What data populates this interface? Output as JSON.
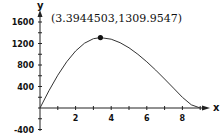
{
  "chart_data": {
    "type": "line",
    "title": "",
    "xlabel": "x",
    "ylabel": "y",
    "xlim": [
      0,
      9.2
    ],
    "ylim": [
      -400,
      1800
    ],
    "grid": false,
    "legend": null,
    "x_ticks": [
      2,
      4,
      6,
      8
    ],
    "x_tick_labels": [
      "2",
      "4",
      "6",
      "8"
    ],
    "y_ticks": [
      -400,
      400,
      800,
      1200,
      1600
    ],
    "y_tick_labels": [
      "-400",
      "400",
      "800",
      "1200",
      "1600"
    ],
    "series": [
      {
        "name": "curve",
        "x": [
          0,
          0.5,
          1,
          1.5,
          2,
          2.5,
          3,
          3.3944503,
          4,
          4.5,
          5,
          5.5,
          6,
          6.5,
          7,
          7.5,
          8,
          8.5,
          9
        ],
        "values": [
          0,
          320,
          610,
          860,
          1060,
          1205,
          1290,
          1309.9547,
          1280,
          1215,
          1120,
          1000,
          860,
          705,
          540,
          370,
          200,
          60,
          0
        ]
      }
    ],
    "annotations": [
      {
        "text": "(3.3944503,1309.9547)",
        "x": 3.3944503,
        "y": 1309.9547,
        "marker": "filled-circle"
      }
    ]
  },
  "labels": {
    "annotation": "(3.3944503,1309.9547)",
    "x_axis": "x",
    "y_axis": "y"
  }
}
